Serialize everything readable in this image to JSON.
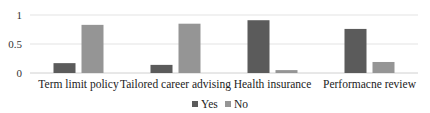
{
  "chart_data": {
    "type": "bar",
    "title": "",
    "xlabel": "",
    "ylabel": "",
    "categories": [
      "Term limit policy",
      "Tailored career advising",
      "Health insurance",
      "Performacne review"
    ],
    "series": [
      {
        "name": "Yes",
        "color": "#5b5b5b",
        "values": [
          0.17,
          0.14,
          0.91,
          0.76
        ]
      },
      {
        "name": "No",
        "color": "#959595",
        "values": [
          0.83,
          0.85,
          0.05,
          0.19
        ]
      }
    ],
    "ylim": [
      0,
      1
    ],
    "yticks": [
      {
        "value": 0,
        "label": "0"
      },
      {
        "value": 0.5,
        "label": "0.5"
      },
      {
        "value": 1,
        "label": "1"
      }
    ],
    "grid": true,
    "legend_position": "bottom"
  }
}
